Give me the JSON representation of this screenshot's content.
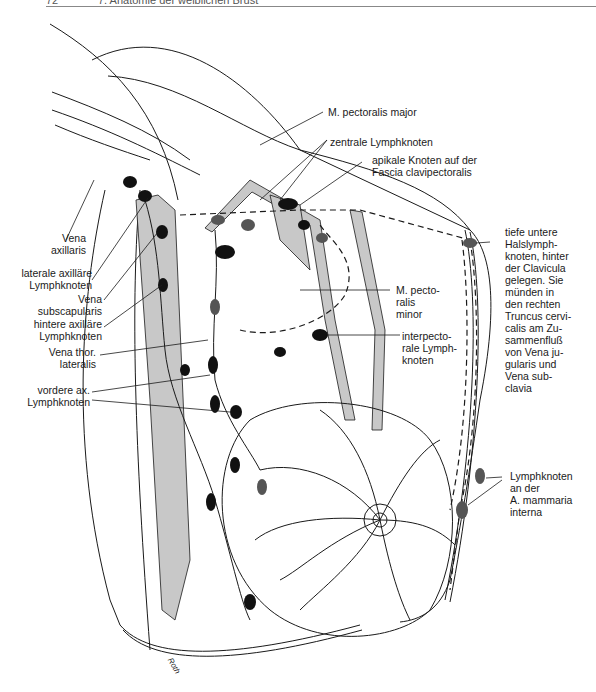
{
  "page": {
    "page_number": "72",
    "chapter_title": "7. Anatomie der weiblichen Brust"
  },
  "figure": {
    "colors": {
      "line": "#1a1a1a",
      "muscle_fill": "#c8c8c8",
      "node": "#111111",
      "paper": "#ffffff"
    },
    "labels_left": [
      {
        "id": "vena-axillaris",
        "lines": [
          "Vena",
          "axillaris"
        ]
      },
      {
        "id": "laterale-axillaere-lymphknoten",
        "lines": [
          "laterale axilläre",
          "Lymphknoten"
        ]
      },
      {
        "id": "vena-subscapularis",
        "lines": [
          "Vena",
          "subscapularis"
        ]
      },
      {
        "id": "hintere-axillaere-lymphknoten",
        "lines": [
          "hintere axilläre",
          "Lymphknoten"
        ]
      },
      {
        "id": "vena-thor-lateralis",
        "lines": [
          "Vena thor.",
          "lateralis"
        ]
      },
      {
        "id": "vordere-ax-lymphknoten",
        "lines": [
          "vordere ax.",
          "Lymphknoten"
        ]
      }
    ],
    "labels_top": [
      {
        "id": "m-pectoralis-major",
        "lines": [
          "M. pectoralis major"
        ]
      },
      {
        "id": "zentrale-lymphknoten",
        "lines": [
          "zentrale Lymphknoten"
        ]
      },
      {
        "id": "apikale-knoten",
        "lines": [
          "apikale Knoten auf der",
          "Fascia clavipectoralis"
        ]
      }
    ],
    "labels_right": [
      {
        "id": "tiefe-untere-halslymphknoten",
        "lines": [
          "tiefe untere",
          "Halslymph-",
          "knoten, hinter",
          "der Clavicula",
          "gelegen. Sie",
          "münden in",
          "den rechten",
          "Truncus cervi-",
          "calis am Zu-",
          "sammenfluß",
          "von Vena ju-",
          "gularis und",
          "Vena sub-",
          "clavia"
        ]
      },
      {
        "id": "m-pectoralis-minor",
        "lines": [
          "M. pecto-",
          "ralis",
          "minor"
        ]
      },
      {
        "id": "interpectorale-lymphknoten",
        "lines": [
          "interpecto-",
          "rale Lymph-",
          "knoten"
        ]
      },
      {
        "id": "lymphknoten-a-mammaria-interna",
        "lines": [
          "Lymphknoten",
          "an der",
          "A. mammaria",
          "interna"
        ]
      }
    ],
    "signature": "Roth"
  }
}
